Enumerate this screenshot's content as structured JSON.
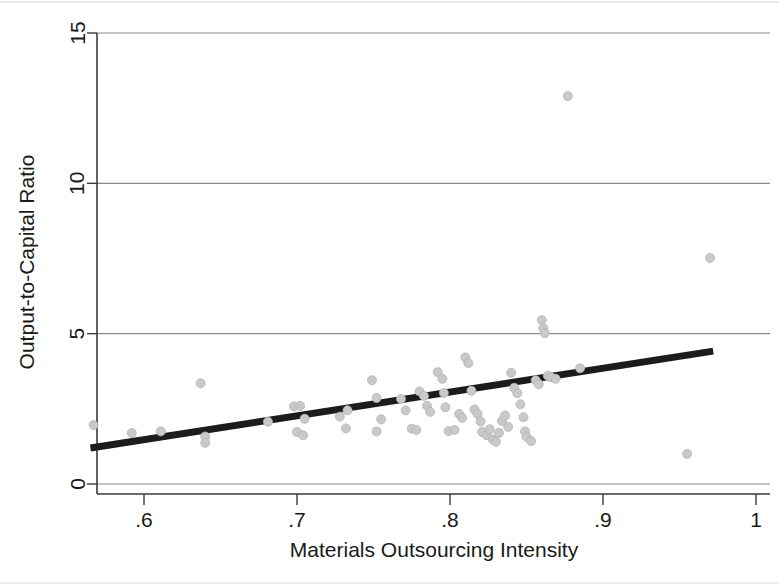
{
  "figure": {
    "background_color": "#ffffff",
    "point_color": "#c9c9c9",
    "line_color": "#1c1c1c",
    "grid_color": "#8a8a8a"
  },
  "chart_data": {
    "type": "scatter",
    "title": "",
    "subtitle": "",
    "xlabel": "Materials Outsourcing Intensity",
    "ylabel": "Output-to-Capital Ratio",
    "xlim": [
      0.555,
      1.0
    ],
    "ylim": [
      0,
      15
    ],
    "xticks": [
      0.6,
      0.7,
      0.8,
      0.9,
      1.0
    ],
    "xtick_labels": [
      ".6",
      ".7",
      ".8",
      ".9",
      "1"
    ],
    "yticks": [
      0,
      5,
      10,
      15
    ],
    "ytick_labels": [
      "0",
      "5",
      "10",
      "15"
    ],
    "grid": "horizontal",
    "legend": "none",
    "marker": "circle",
    "marker_size": 7,
    "points": [
      [
        0.567,
        1.96
      ],
      [
        0.592,
        1.7
      ],
      [
        0.611,
        1.75
      ],
      [
        0.637,
        3.35
      ],
      [
        0.64,
        1.58
      ],
      [
        0.64,
        1.37
      ],
      [
        0.681,
        2.07
      ],
      [
        0.698,
        2.58
      ],
      [
        0.702,
        2.6
      ],
      [
        0.705,
        2.17
      ],
      [
        0.7,
        1.73
      ],
      [
        0.704,
        1.62
      ],
      [
        0.728,
        2.24
      ],
      [
        0.733,
        2.45
      ],
      [
        0.732,
        1.85
      ],
      [
        0.749,
        3.45
      ],
      [
        0.752,
        2.86
      ],
      [
        0.755,
        2.15
      ],
      [
        0.752,
        1.75
      ],
      [
        0.768,
        2.83
      ],
      [
        0.771,
        2.45
      ],
      [
        0.775,
        1.84
      ],
      [
        0.778,
        1.8
      ],
      [
        0.78,
        3.08
      ],
      [
        0.783,
        2.93
      ],
      [
        0.785,
        2.6
      ],
      [
        0.787,
        2.4
      ],
      [
        0.792,
        3.72
      ],
      [
        0.795,
        3.5
      ],
      [
        0.796,
        3.03
      ],
      [
        0.797,
        2.55
      ],
      [
        0.799,
        1.76
      ],
      [
        0.803,
        1.8
      ],
      [
        0.806,
        2.33
      ],
      [
        0.808,
        2.2
      ],
      [
        0.81,
        4.21
      ],
      [
        0.812,
        4.02
      ],
      [
        0.814,
        3.1
      ],
      [
        0.816,
        2.48
      ],
      [
        0.818,
        2.33
      ],
      [
        0.82,
        2.08
      ],
      [
        0.821,
        1.73
      ],
      [
        0.824,
        1.62
      ],
      [
        0.826,
        1.82
      ],
      [
        0.828,
        1.48
      ],
      [
        0.83,
        1.4
      ],
      [
        0.832,
        1.7
      ],
      [
        0.834,
        2.1
      ],
      [
        0.836,
        2.28
      ],
      [
        0.838,
        1.9
      ],
      [
        0.84,
        3.7
      ],
      [
        0.842,
        3.2
      ],
      [
        0.844,
        3.02
      ],
      [
        0.846,
        2.65
      ],
      [
        0.848,
        2.22
      ],
      [
        0.849,
        1.75
      ],
      [
        0.85,
        1.57
      ],
      [
        0.853,
        1.43
      ],
      [
        0.856,
        3.45
      ],
      [
        0.858,
        3.32
      ],
      [
        0.86,
        5.45
      ],
      [
        0.861,
        5.18
      ],
      [
        0.862,
        5.02
      ],
      [
        0.864,
        3.6
      ],
      [
        0.866,
        3.55
      ],
      [
        0.869,
        3.5
      ],
      [
        0.877,
        12.9
      ],
      [
        0.885,
        3.85
      ],
      [
        0.955,
        1.0
      ],
      [
        0.97,
        7.52
      ]
    ],
    "fit_line": {
      "x_start": 0.565,
      "y_start": 1.2,
      "x_end": 0.972,
      "y_end": 4.42,
      "style": "solid",
      "width": 7
    }
  }
}
